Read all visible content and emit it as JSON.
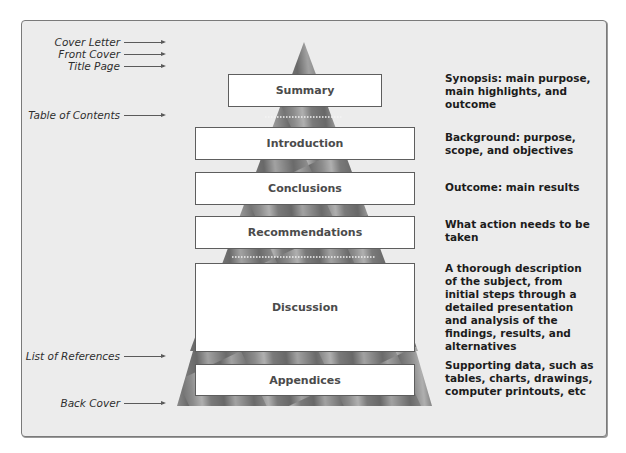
{
  "diagram": {
    "type": "report-structure-pyramid",
    "colors": {
      "frame_bg": "#ececec",
      "frame_border": "#7a7a7a",
      "pyramid_dark": "#6a6a6a",
      "pyramid_light": "#b0b0b0",
      "box_fill": "#ffffff",
      "box_border": "#5e5e5e",
      "box_text": "#4b4b4b",
      "desc_text": "#1c1c1c"
    },
    "left_labels": [
      {
        "label": "Cover Letter"
      },
      {
        "label": "Front Cover"
      },
      {
        "label": "Title Page"
      },
      {
        "label": "Table of Contents"
      },
      {
        "label": "List of References"
      },
      {
        "label": "Back Cover"
      }
    ],
    "sections": [
      {
        "label": "Summary",
        "description": "Synopsis: main purpose, main highlights, and outcome"
      },
      {
        "label": "Introduction",
        "description": "Background: purpose, scope, and objectives"
      },
      {
        "label": "Conclusions",
        "description": "Outcome: main results"
      },
      {
        "label": "Recommendations",
        "description": "What action needs to be taken"
      },
      {
        "label": "Discussion",
        "description": "A thorough description of the subject, from initial steps through a detailed presentation and analysis of the findings, results, and alternatives"
      },
      {
        "label": "Appendices",
        "description": "Supporting data, such as tables, charts, drawings, computer printouts, etc"
      }
    ]
  }
}
